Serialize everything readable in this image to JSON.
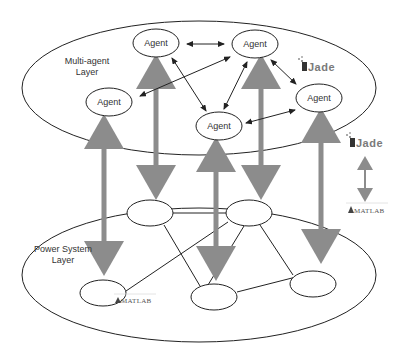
{
  "diagram": {
    "type": "layered-architecture",
    "layers": [
      {
        "id": "multi-agent",
        "label_line1": "Multi-agent",
        "label_line2": "Layer"
      },
      {
        "id": "power-system",
        "label_line1": "Power System",
        "label_line2": "Layer"
      }
    ],
    "agents": [
      {
        "id": "a1",
        "label": "Agent"
      },
      {
        "id": "a2",
        "label": "Agent"
      },
      {
        "id": "a3",
        "label": "Agent"
      },
      {
        "id": "a4",
        "label": "Agent"
      },
      {
        "id": "a5",
        "label": "Agent"
      }
    ],
    "power_nodes": [
      "p1",
      "p2",
      "p3",
      "p4",
      "p5"
    ],
    "agent_links": [
      [
        "a1",
        "a2"
      ],
      [
        "a1",
        "a4"
      ],
      [
        "a2",
        "a3"
      ],
      [
        "a2",
        "a4"
      ],
      [
        "a2",
        "a5"
      ],
      [
        "a4",
        "a5"
      ]
    ],
    "power_links": [
      [
        "p1",
        "p2"
      ],
      [
        "p1",
        "p4"
      ],
      [
        "p2",
        "p3"
      ],
      [
        "p2",
        "p4"
      ],
      [
        "p2",
        "p5"
      ],
      [
        "p4",
        "p5"
      ]
    ],
    "vertical_links": [
      [
        "a3",
        "p3"
      ],
      [
        "a1",
        "p1"
      ],
      [
        "a4",
        "p4"
      ],
      [
        "a2",
        "p2"
      ],
      [
        "a5",
        "p5"
      ]
    ],
    "logos": {
      "jade": "Jade",
      "matlab": "MATLAB"
    },
    "colors": {
      "stroke": "#222222",
      "thick_arrow": "#8c8c8c",
      "background": "#ffffff"
    }
  }
}
